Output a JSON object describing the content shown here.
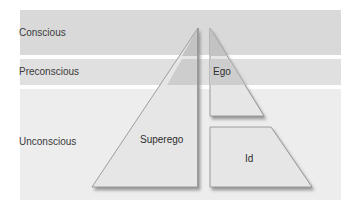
{
  "diagram": {
    "levels": [
      {
        "label": "Conscious",
        "color": "#d9d9d9"
      },
      {
        "label": "Preconscious",
        "color": "#e0e0e0"
      },
      {
        "label": "Unconscious",
        "color": "#ececec"
      }
    ],
    "structures": [
      {
        "label": "Superego"
      },
      {
        "label": "Ego"
      },
      {
        "label": "Id"
      }
    ],
    "colors": {
      "shape_fill_light": "#e6e6e6",
      "shape_fill_dark": "#c4c4c4",
      "shape_edge": "#8a8a8a",
      "shadow": "#9a9a9a"
    }
  }
}
